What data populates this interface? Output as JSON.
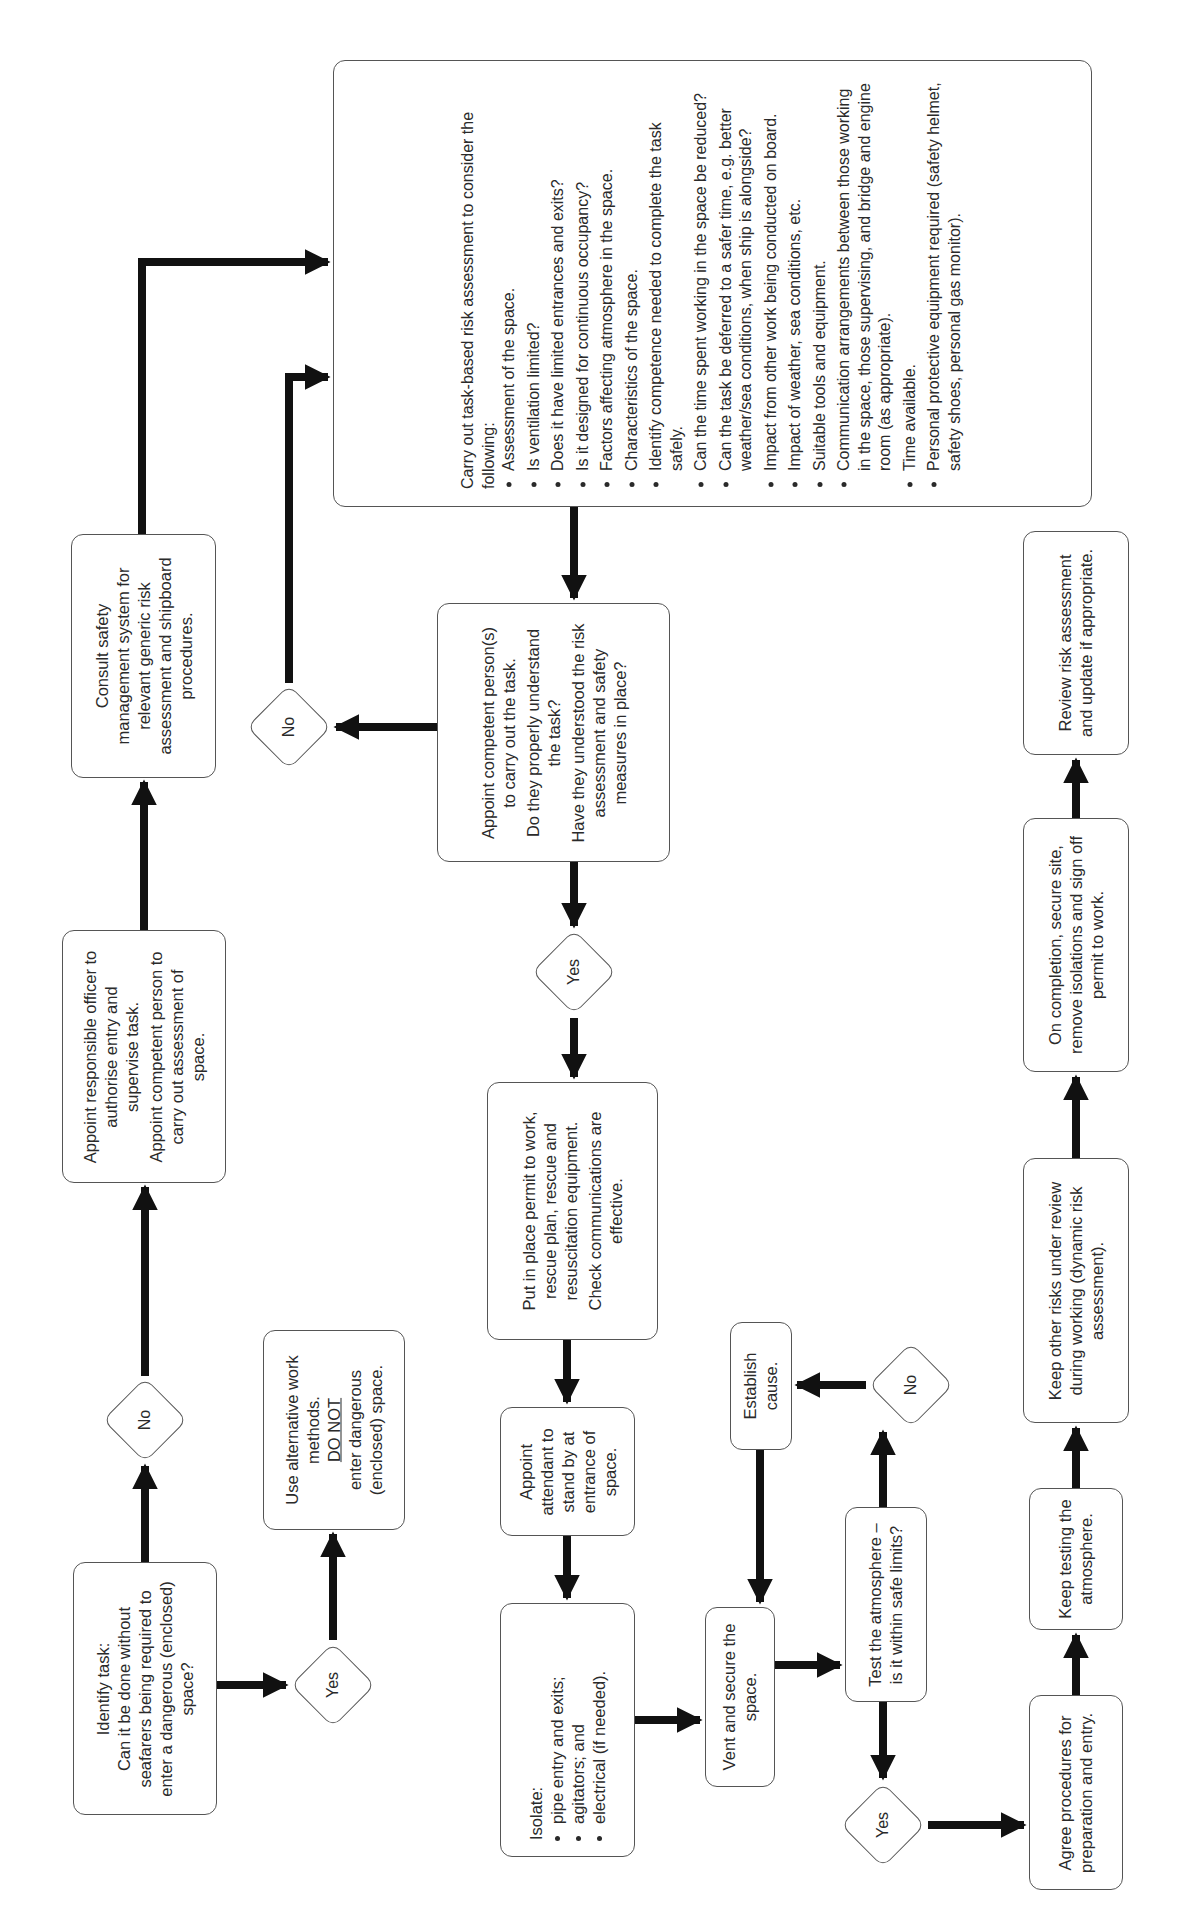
{
  "diagram": {
    "orientation": "rotated 90 degrees counter-clockwise",
    "nodes": {
      "identify_task": {
        "title": "Identify task:",
        "text": "Can it be done without seafarers being required to enter a dangerous (enclosed) space?"
      },
      "decision_no_1": {
        "label": "No"
      },
      "decision_yes_1": {
        "label": "Yes"
      },
      "use_alternative": {
        "line1": "Use alternative work methods.",
        "emphasis": "DO NOT",
        "line2": "enter dangerous (enclosed) space."
      },
      "appoint_responsible": {
        "p1": "Appoint responsible officer to authorise entry and supervise task.",
        "p2": "Appoint competent person to carry out assessment of space."
      },
      "consult_sms": {
        "text": "Consult safety management system for relevant generic risk assessment and shipboard procedures."
      },
      "risk_assessment": {
        "intro": "Carry out task-based risk assessment to consider the following:",
        "items": [
          "Assessment of the space.",
          "Is ventilation limited?",
          "Does it have limited entrances and exits?",
          "Is it designed for continuous occupancy?",
          "Factors affecting atmosphere in the space.",
          "Characteristics of the space.",
          "Identify competence needed to complete the task safely.",
          "Can the time spent working in the space be reduced?",
          "Can the task be deferred to a safer time, e.g. better weather/sea conditions, when ship is alongside?",
          "Impact from other work being conducted on board.",
          "Impact of weather, sea conditions, etc.",
          "Suitable tools and equipment.",
          "Communication arrangements between those working in the space, those supervising, and bridge and engine room (as appropriate).",
          "Time available.",
          "Personal protective equipment required (safety helmet, safety shoes, personal gas monitor)."
        ]
      },
      "appoint_competent": {
        "p1": "Appoint competent person(s) to carry out the task.",
        "p2": "Do they properly understand the task?",
        "p3": "Have they understood the risk assessment and safety measures in place?"
      },
      "decision_no_2": {
        "label": "No"
      },
      "decision_yes_2": {
        "label": "Yes"
      },
      "permit_to_work": {
        "p1": "Put in place permit to work, rescue plan, rescue and resuscitation equipment.",
        "p2": "Check communications are effective."
      },
      "appoint_attendant": {
        "text": "Appoint attendant to stand by at entrance of space."
      },
      "isolate": {
        "title": "Isolate:",
        "items": [
          "pipe entry and exits;",
          "agitators; and",
          "electrical (if needed)."
        ]
      },
      "vent_secure": {
        "text": "Vent and secure the space."
      },
      "test_atmosphere": {
        "text": "Test the atmosphere – is it within safe limits?"
      },
      "decision_no_3": {
        "label": "No"
      },
      "establish_cause": {
        "text": "Establish cause."
      },
      "decision_yes_3": {
        "label": "Yes"
      },
      "agree_procedures": {
        "text": "Agree procedures for preparation and entry."
      },
      "keep_testing": {
        "text": "Keep testing the atmosphere."
      },
      "keep_other_risks": {
        "text": "Keep other risks under review during working (dynamic risk assessment)."
      },
      "on_completion": {
        "text": "On completion, secure site, remove isolations and sign off permit to work."
      },
      "review_risk": {
        "text": "Review risk assessment and update if appropriate."
      }
    },
    "colors": {
      "line": "#111111",
      "box_border": "#555555",
      "background": "#ffffff",
      "text": "#2a2a2a"
    }
  }
}
